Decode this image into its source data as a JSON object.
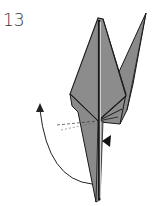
{
  "step": {
    "number": "13"
  },
  "diagram": {
    "instruction_symbols": [
      "curved-fold-arrow",
      "push-arrow",
      "dashed-fold-lines"
    ],
    "colors": {
      "paper": "#8c8c8c",
      "paper_dark": "#7a7a7a",
      "outline": "#1a1a1a",
      "arrow": "#222222",
      "background": "#ffffff"
    }
  }
}
